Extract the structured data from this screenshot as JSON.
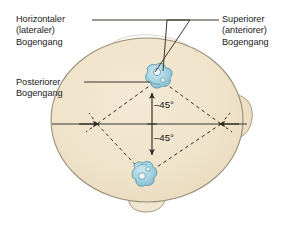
{
  "figure": {
    "view": "axial view of head from above",
    "colors": {
      "background": "#ffffff",
      "head_fill": "#f0e4cd",
      "head_fill_inner": "#ece0c6",
      "head_outline": "#9a8e77",
      "labyrinth_fill": "#9ecfdd",
      "labyrinth_fill_light": "#c3e2ea",
      "labyrinth_outline": "#5d97ac",
      "line": "#3b372f",
      "dashed_line": "#2e2a24",
      "text": "#1b1b1b"
    }
  },
  "labels": {
    "horizontal": {
      "line1": "Horizontaler",
      "line2": "(lateraler)",
      "line3": "Bogengang"
    },
    "posterior": {
      "line1": "Posteriorer",
      "line2": "Bogengang"
    },
    "superior": {
      "line1": "Superiorer",
      "line2": "(anteriorer)",
      "line3": "Bogengang"
    }
  },
  "annotations": {
    "angle_upper": "–45°",
    "angle_lower": "–45°"
  },
  "anatomy": {
    "labyrinth_upper_name": "right-labyrinth",
    "labyrinth_lower_name": "left-labyrinth",
    "head_name": "head-outline",
    "ear_name": "right-ear",
    "nose_name": "nose"
  }
}
